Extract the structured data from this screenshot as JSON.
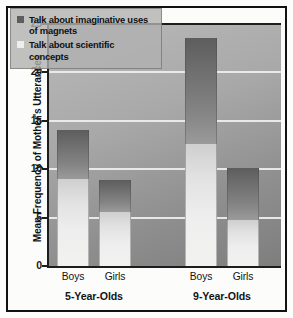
{
  "chart_data": {
    "type": "bar",
    "title": "",
    "xlabel": "",
    "ylabel": "Mean Frequency of Mother's Utterances",
    "ylim": [
      0,
      25
    ],
    "yticks": [
      0,
      5,
      10,
      15,
      20,
      25
    ],
    "grid": true,
    "stacked": true,
    "legend_position": "top-left",
    "groups": [
      {
        "name": "5-Year-Olds",
        "categories": [
          "Boys",
          "Girls"
        ]
      },
      {
        "name": "9-Year-Olds",
        "categories": [
          "Boys",
          "Girls"
        ]
      }
    ],
    "categories": [
      "Boys",
      "Girls",
      "Boys",
      "Girls"
    ],
    "series": [
      {
        "name": "Talk about scientific concepts",
        "color": "#eeeeec",
        "values": [
          9.0,
          5.6,
          12.6,
          4.8
        ]
      },
      {
        "name": "Talk about imaginative uses of magnets",
        "color": "#5e5e5e",
        "values": [
          5.0,
          3.3,
          11.0,
          5.3
        ]
      }
    ],
    "bar_totals": [
      14.0,
      8.9,
      23.6,
      10.1
    ]
  },
  "axis": {
    "y_title": "Mean Frequency of Mother's Utterances",
    "tick_labels": [
      "25",
      "20",
      "15",
      "10",
      "5",
      "0"
    ]
  },
  "legend": {
    "entries": [
      {
        "swatch": "dark",
        "label": "Talk about imaginative uses of magnets"
      },
      {
        "swatch": "light",
        "label": "Talk about scientific concepts"
      }
    ]
  },
  "xaxis": {
    "category_labels": [
      "Boys",
      "Girls",
      "Boys",
      "Girls"
    ],
    "group_labels": [
      "5-Year-Olds",
      "9-Year-Olds"
    ]
  },
  "colors": {
    "frame": "#121212",
    "plot_background": "#a9a9a9",
    "gridline": "#efefef",
    "bar_dark": "#5e5e5e",
    "bar_light": "#eeeeec",
    "text": "#131313"
  }
}
